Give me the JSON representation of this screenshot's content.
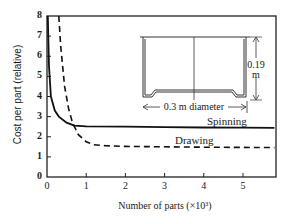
{
  "chart_data": {
    "type": "line",
    "title": "",
    "xlabel": "Number of parts (×10³)",
    "ylabel": "Cost per part (relative)",
    "xlim": [
      0,
      5.8
    ],
    "ylim": [
      0,
      8
    ],
    "x_ticks": [
      "0",
      "1",
      "2",
      "3",
      "4",
      "5"
    ],
    "y_ticks": [
      "0",
      "1",
      "2",
      "3",
      "4",
      "5",
      "6",
      "7",
      "8"
    ],
    "grid": false,
    "series": [
      {
        "name": "Spinning",
        "style": "solid",
        "x": [
          0.02,
          0.05,
          0.1,
          0.2,
          0.3,
          0.5,
          0.7,
          1.0,
          2.0,
          3.0,
          4.0,
          5.0,
          5.8
        ],
        "values": [
          8.0,
          5.5,
          4.0,
          3.3,
          3.0,
          2.7,
          2.55,
          2.52,
          2.5,
          2.48,
          2.46,
          2.45,
          2.44
        ]
      },
      {
        "name": "Drawing",
        "style": "dashed",
        "x": [
          0.3,
          0.35,
          0.45,
          0.55,
          0.65,
          0.8,
          1.0,
          1.2,
          1.5,
          2.0,
          3.0,
          4.0,
          5.0,
          5.8
        ],
        "values": [
          8.0,
          6.5,
          4.5,
          3.4,
          2.7,
          2.1,
          1.75,
          1.6,
          1.55,
          1.52,
          1.5,
          1.48,
          1.47,
          1.46
        ]
      }
    ],
    "annotations": [
      {
        "text": "Spinning",
        "near_series": "Spinning"
      },
      {
        "text": "Drawing",
        "near_series": "Drawing"
      },
      {
        "text": "0.19 m",
        "meaning": "inset part height"
      },
      {
        "text": "0.3 m diameter",
        "meaning": "inset part diameter"
      }
    ],
    "inset": "cross-section sketch of a cylindrical pan-shaped part"
  },
  "labels": {
    "xlabel": "Number of parts (×10³)",
    "ylabel": "Cost per part (relative)",
    "spinning": "Spinning",
    "drawing": "Drawing",
    "height_dim_1": "0.19",
    "height_dim_2": "m",
    "diameter_dim": "0.3 m diameter"
  }
}
